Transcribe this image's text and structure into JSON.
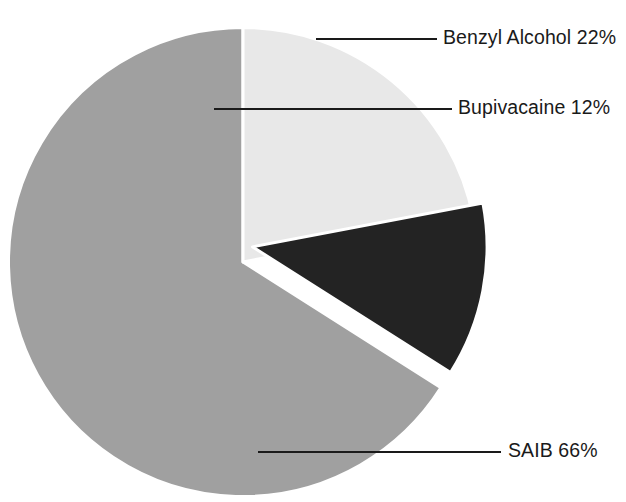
{
  "chart_data": {
    "type": "pie",
    "title": "",
    "subtitle": "",
    "xlabel": "",
    "ylabel": "",
    "grid": false,
    "legend_position": "none",
    "label_style": "leader-line callouts outside slices",
    "units": "percent",
    "total": 100,
    "categories": [
      "Benzyl Alcohol",
      "Bupivacaine",
      "SAIB"
    ],
    "values": [
      22,
      12,
      66
    ],
    "labels": [
      "Benzyl Alcohol 22%",
      "Bupivacaine 12%",
      "SAIB 66%"
    ],
    "slices": [
      {
        "name": "Benzyl Alcohol",
        "value": 22,
        "value_text": "22%",
        "label": "Benzyl Alcohol 22%",
        "color": "#e8e8e8",
        "start_angle_deg": 0,
        "end_angle_deg": 79.2,
        "exploded": false
      },
      {
        "name": "Bupivacaine",
        "value": 12,
        "value_text": "12%",
        "label": "Bupivacaine 12%",
        "color": "#232323",
        "start_angle_deg": 79.2,
        "end_angle_deg": 122.4,
        "exploded": true
      },
      {
        "name": "SAIB",
        "value": 66,
        "value_text": "66%",
        "label": "SAIB 66%",
        "color": "#a0a0a0",
        "start_angle_deg": 122.4,
        "end_angle_deg": 360,
        "exploded": false
      }
    ],
    "colors": {
      "benzyl_alcohol": "#e8e8e8",
      "bupivacaine": "#232323",
      "saib": "#a0a0a0",
      "background": "#ffffff",
      "leader_line": "#1a1a1a",
      "text": "#1a1a1a",
      "separator": "#ffffff"
    }
  }
}
